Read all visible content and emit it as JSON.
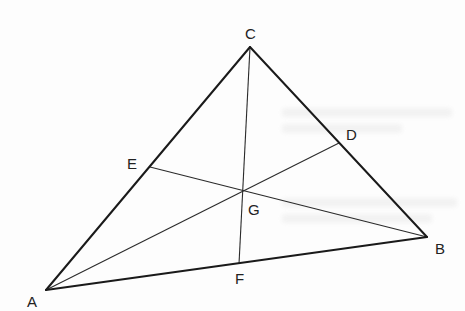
{
  "diagram": {
    "type": "triangle-medians",
    "colors": {
      "line": "#1a1a1a",
      "median": "#2a2a2a",
      "label": "#222222",
      "background": "#fdfdfd"
    },
    "vertices": {
      "A": {
        "label": "A",
        "x": 46,
        "y": 290
      },
      "B": {
        "label": "B",
        "x": 427,
        "y": 237
      },
      "C": {
        "label": "C",
        "x": 250,
        "y": 47
      }
    },
    "midpoints": {
      "D": {
        "label": "D",
        "x": 339,
        "y": 143,
        "on": "BC"
      },
      "E": {
        "label": "E",
        "x": 150,
        "y": 167,
        "on": "AC"
      },
      "F": {
        "label": "F",
        "x": 239,
        "y": 264,
        "on": "AB"
      }
    },
    "centroid": {
      "label": "G",
      "x": 243,
      "y": 191
    },
    "medians": [
      "AD",
      "BE",
      "CF"
    ]
  }
}
